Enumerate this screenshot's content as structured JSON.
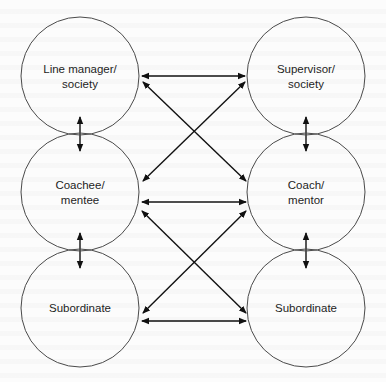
{
  "diagram": {
    "title": "",
    "type": "relationship-network",
    "colors": {
      "background": "#fcfcfc",
      "circle_stroke": "#4a4a4a",
      "arrow": "#111111",
      "text": "#1e1e1e"
    },
    "nodes": [
      {
        "id": "line_manager",
        "label_lines": [
          "Line manager/",
          "society"
        ],
        "cx": 80,
        "cy": 76,
        "r": 59
      },
      {
        "id": "supervisor",
        "label_lines": [
          "Supervisor/",
          "society"
        ],
        "cx": 306,
        "cy": 76,
        "r": 59
      },
      {
        "id": "coachee",
        "label_lines": [
          "Coachee/",
          "mentee"
        ],
        "cx": 80,
        "cy": 192,
        "r": 59
      },
      {
        "id": "coach",
        "label_lines": [
          "Coach/",
          "mentor"
        ],
        "cx": 306,
        "cy": 192,
        "r": 59
      },
      {
        "id": "subordinate_left",
        "label_lines": [
          "Subordinate"
        ],
        "cx": 80,
        "cy": 308,
        "r": 59
      },
      {
        "id": "subordinate_right",
        "label_lines": [
          "Subordinate"
        ],
        "cx": 306,
        "cy": 308,
        "r": 59
      }
    ],
    "edges": [
      {
        "from": "line_manager",
        "to": "supervisor",
        "direction": "bidirectional",
        "x1": 142,
        "y1": 76,
        "x2": 245,
        "y2": 76
      },
      {
        "from": "line_manager",
        "to": "coach",
        "direction": "bidirectional",
        "x1": 143,
        "y1": 82,
        "x2": 246,
        "y2": 181
      },
      {
        "from": "supervisor",
        "to": "coachee",
        "direction": "bidirectional",
        "x1": 245,
        "y1": 82,
        "x2": 143,
        "y2": 181
      },
      {
        "from": "coachee",
        "to": "coach",
        "direction": "bidirectional",
        "x1": 142,
        "y1": 202,
        "x2": 246,
        "y2": 202
      },
      {
        "from": "coachee",
        "to": "subordinate_right",
        "direction": "bidirectional",
        "x1": 142,
        "y1": 211,
        "x2": 246,
        "y2": 313
      },
      {
        "from": "coach",
        "to": "subordinate_left",
        "direction": "bidirectional",
        "x1": 246,
        "y1": 211,
        "x2": 143,
        "y2": 313
      },
      {
        "from": "subordinate_left",
        "to": "subordinate_right",
        "direction": "bidirectional",
        "x1": 142,
        "y1": 321,
        "x2": 246,
        "y2": 321
      },
      {
        "from": "line_manager",
        "to": "coachee",
        "direction": "bidirectional",
        "x1": 80,
        "y1": 117,
        "x2": 80,
        "y2": 151
      },
      {
        "from": "supervisor",
        "to": "coach",
        "direction": "bidirectional",
        "x1": 306,
        "y1": 117,
        "x2": 306,
        "y2": 151
      },
      {
        "from": "coachee",
        "to": "subordinate_left",
        "direction": "bidirectional",
        "x1": 80,
        "y1": 233,
        "x2": 80,
        "y2": 268
      },
      {
        "from": "coach",
        "to": "subordinate_right",
        "direction": "bidirectional",
        "x1": 306,
        "y1": 233,
        "x2": 306,
        "y2": 268
      }
    ]
  }
}
